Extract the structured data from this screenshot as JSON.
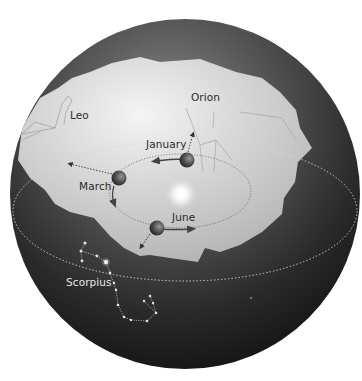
{
  "diagram": {
    "colors": {
      "sphere_dark": "#1c1c1c",
      "sphere_mid": "#4a4a4a",
      "sky_region": "#c9c9c9",
      "sky_region_highlight": "#ececec",
      "orbit_line": "#555555",
      "ecliptic_line": "#d0d0d0",
      "constellation_line": "#a8a8a8",
      "scorpius_star": "#e0e0e0"
    },
    "constellations": {
      "leo": {
        "label": "Leo"
      },
      "orion": {
        "label": "Orion"
      },
      "scorpius": {
        "label": "Scorpius"
      }
    },
    "earth_positions": {
      "january": {
        "label": "January"
      },
      "march": {
        "label": "March"
      },
      "june": {
        "label": "June"
      }
    },
    "icons": {
      "sun": "sun-glow",
      "earth": "earth-sphere",
      "direction_arrow": "dotted-arrow"
    }
  }
}
